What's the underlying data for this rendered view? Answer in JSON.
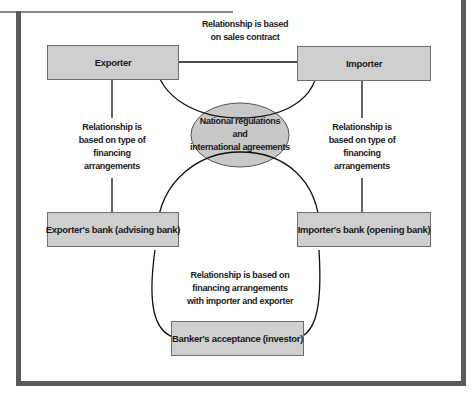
{
  "diagram": {
    "nodes": {
      "exporter": "Exporter",
      "importer": "Importer",
      "exporters_bank": "Exporter's bank (advising bank)",
      "importers_bank": "Importer's bank (opening bank)",
      "bankers_acceptance": "Banker's acceptance (investor)",
      "center": {
        "line1": "National regulations",
        "line2": "and",
        "line3": "international agreements"
      }
    },
    "labels": {
      "top": {
        "line1": "Relationship is based",
        "line2": "on sales contract"
      },
      "left": {
        "line1": "Relationship is",
        "line2": "based on type of",
        "line3": "financing",
        "line4": "arrangements"
      },
      "right": {
        "line1": "Relationship is",
        "line2": "based on type of",
        "line3": "financing",
        "line4": "arrangements"
      },
      "bottom": {
        "line1": "Relationship is based on",
        "line2": "financing arrangements",
        "line3": "with importer and exporter"
      }
    },
    "colors": {
      "box_fill": "#cfcfcf",
      "oval_fill": "#c8c8c8",
      "frame": "#5a5a5a",
      "line": "#111111"
    }
  }
}
